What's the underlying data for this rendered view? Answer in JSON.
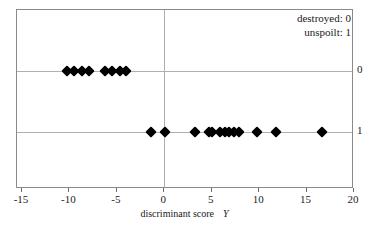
{
  "legend": {
    "position": "top-right",
    "entries": [
      {
        "label": "destroyed: 0"
      },
      {
        "label": "unspoilt: 1"
      }
    ]
  },
  "axes": {
    "xlabel_text": "discriminant score",
    "xlabel_symbol": "Y",
    "xticks": [
      "-15",
      "-10",
      "-5",
      "0",
      "5",
      "10",
      "15",
      "20"
    ],
    "yticks": [
      "1",
      "0"
    ]
  },
  "chart_data": {
    "type": "scatter",
    "title": "",
    "subtitle": "",
    "xlabel": "discriminant score  Y",
    "ylabel": "",
    "xlim": [
      -15,
      20
    ],
    "ylim": [
      -0.62,
      1.48
    ],
    "xticks": [
      -15,
      -10,
      -5,
      0,
      5,
      10,
      15,
      20
    ],
    "yticks": [
      0,
      1
    ],
    "grid": "horizontal-at-yticks-plus-vertical-at-x0",
    "legend": [
      "destroyed: 0",
      "unspoilt: 1"
    ],
    "marker": "filled-black-diamond",
    "series": [
      {
        "name": "unspoilt: 1",
        "y": 1,
        "x": [
          -10.3,
          -9.5,
          -8.7,
          -7.9,
          -6.3,
          -5.5,
          -4.7,
          -4.0
        ]
      },
      {
        "name": "destroyed: 0",
        "y": 0,
        "x": [
          -1.4,
          0.1,
          3.2,
          4.7,
          5.0,
          5.9,
          6.4,
          6.8,
          7.4,
          7.9,
          9.8,
          11.8,
          16.6
        ]
      }
    ]
  }
}
